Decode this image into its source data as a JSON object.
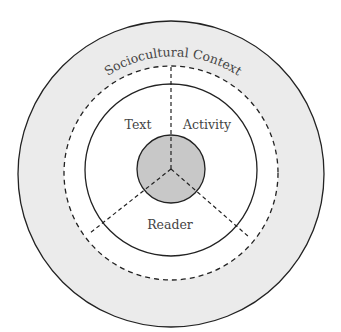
{
  "diagram": {
    "type": "concentric-circles",
    "outer_label": "Sociocultural Context",
    "segments": [
      {
        "label": "Text"
      },
      {
        "label": "Activity"
      },
      {
        "label": "Reader"
      }
    ],
    "colors": {
      "outer_ring_fill": "#ebebeb",
      "inner_fill": "#ffffff",
      "core_fill": "#c8c8c8",
      "stroke": "#222222",
      "label": "#444444"
    }
  }
}
